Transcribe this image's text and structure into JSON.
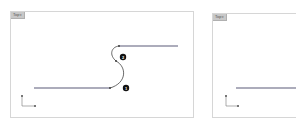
{
  "viewports": [
    {
      "name": "Top",
      "tab_label": "Top",
      "caret": "▾",
      "badges": [
        {
          "label": "2",
          "x": 122,
          "y": 56
        },
        {
          "label": "1",
          "x": 125,
          "y": 87
        }
      ]
    },
    {
      "name": "Top",
      "tab_label": "Top",
      "caret": "▾"
    }
  ],
  "axis": {
    "x_label": "x",
    "y_label": "y"
  },
  "colors": {
    "line": "#5a5a78",
    "curve": "#444444",
    "badge_bg": "#111111",
    "badge_fg": "#ffffff",
    "border": "#d6d6d6",
    "tab_bg": "#c8c8c8"
  }
}
